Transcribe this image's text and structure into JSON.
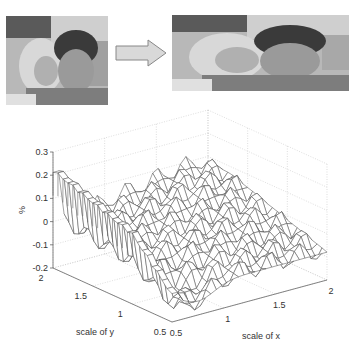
{
  "figure": {
    "top_caption_cutoff": "",
    "left_image": {
      "alt": "original photo of two children (grayscale)",
      "width_px": 102,
      "height_px": 89
    },
    "arrow": {
      "direction": "right",
      "fill": "#d9d9d9",
      "stroke": "#888888"
    },
    "right_image": {
      "alt": "resized/stretched photo of two children (grayscale)",
      "width_px": 177,
      "height_px": 76
    }
  },
  "chart_data": {
    "type": "surface",
    "title": "",
    "xlabel": "scale of x",
    "ylabel": "scale of y",
    "zlabel": "%",
    "xlim": [
      0.5,
      2
    ],
    "ylim": [
      0.5,
      2
    ],
    "zlim": [
      -0.2,
      0.3
    ],
    "xticks": [
      "0.5",
      "1",
      "1.5",
      "2"
    ],
    "yticks": [
      "0.5",
      "1",
      "1.5",
      "2"
    ],
    "zticks": [
      "-0.2",
      "-0.1",
      "0",
      "0.1",
      "0.2",
      "0.3"
    ],
    "grid": true,
    "grid_style": "dotted",
    "mesh_color": "#555555",
    "edge_values_at_x_min": {
      "y": [
        2.0,
        1.75,
        1.5,
        1.25,
        1.0
      ],
      "z": [
        0.22,
        0.2,
        0.17,
        0.14,
        0.1
      ]
    },
    "approx_range": [
      -0.18,
      0.23
    ]
  }
}
